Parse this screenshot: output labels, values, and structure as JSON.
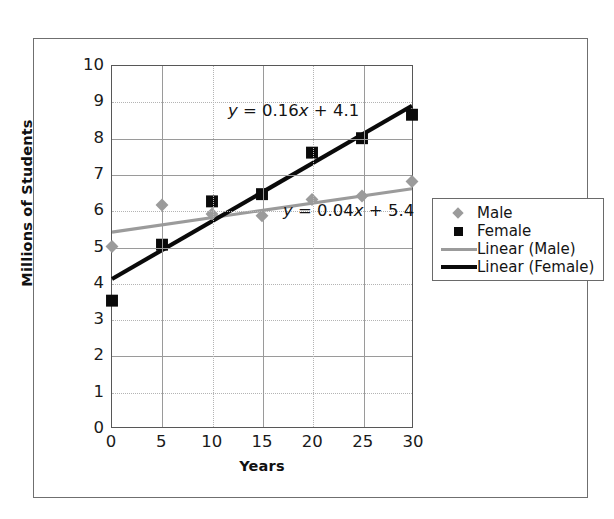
{
  "chart_data": {
    "type": "scatter",
    "title": "",
    "xlabel": "Years",
    "ylabel": "Millions of Students",
    "xlim": [
      0,
      30
    ],
    "ylim": [
      0,
      10
    ],
    "xticks": [
      "0",
      "5",
      "10",
      "15",
      "20",
      "25",
      "30"
    ],
    "yticks": [
      "10",
      "9",
      "8",
      "7",
      "6",
      "5",
      "4",
      "3",
      "2",
      "1",
      "0"
    ],
    "grid": "both",
    "legend_position": "right",
    "x": [
      0,
      5,
      10,
      15,
      20,
      25,
      30
    ],
    "series": [
      {
        "name": "Male",
        "marker": "diamond",
        "color": "#9b9b9b",
        "values": [
          5.0,
          6.15,
          5.9,
          5.85,
          6.3,
          6.4,
          6.8
        ]
      },
      {
        "name": "Female",
        "marker": "square",
        "color": "#0a0a0a",
        "values": [
          3.5,
          5.05,
          6.25,
          6.45,
          7.6,
          8.0,
          8.65
        ]
      }
    ],
    "trendlines": [
      {
        "name": "Linear (Male)",
        "color": "#9b9b9b",
        "slope": 0.04,
        "intercept": 5.4,
        "equation": "y = 0.04x + 5.4",
        "equation_parts": {
          "y": "y",
          "eq": " = 0.04",
          "x": "x",
          "rest": " + 5.4"
        }
      },
      {
        "name": "Linear (Female)",
        "color": "#0a0a0a",
        "slope": 0.16,
        "intercept": 4.1,
        "equation": "y = 0.16x + 4.1",
        "equation_parts": {
          "y": "y",
          "eq": " = 0.16",
          "x": "x",
          "rest": " + 4.1"
        }
      }
    ],
    "annotations": [
      {
        "id": "eq-female",
        "text": "y = 0.16x + 4.1"
      },
      {
        "id": "eq-male",
        "text": "y = 0.04x + 5.4"
      }
    ]
  },
  "legend": {
    "items": [
      {
        "label": "Male",
        "key": "diamond-marker-gray"
      },
      {
        "label": "Female",
        "key": "square-marker-black"
      },
      {
        "label": "Linear (Male)",
        "key": "line-gray"
      },
      {
        "label": "Linear (Female)",
        "key": "line-black"
      }
    ]
  },
  "axes": {
    "x_title": "Years",
    "y_title": "Millions of Students",
    "x_ticks": [
      "0",
      "5",
      "10",
      "15",
      "20",
      "25",
      "30"
    ],
    "y_ticks": [
      "10",
      "9",
      "8",
      "7",
      "6",
      "5",
      "4",
      "3",
      "2",
      "1",
      "0"
    ]
  },
  "colors": {
    "male": "#9b9b9b",
    "female": "#0a0a0a",
    "grid": "#9a9a9a",
    "grid_minor": "#b4b4b4",
    "frame": "#6f6f6f",
    "text": "#141414"
  }
}
